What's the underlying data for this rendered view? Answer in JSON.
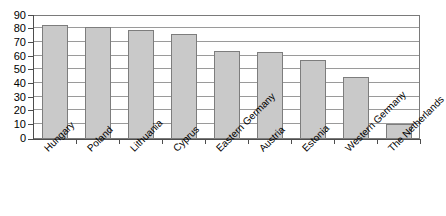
{
  "chart_data": {
    "type": "bar",
    "title": "",
    "subtitle": "",
    "xlabel": "",
    "ylabel": "",
    "ylim": [
      0,
      90
    ],
    "ytick_step": 10,
    "yticks": [
      0,
      10,
      20,
      30,
      40,
      50,
      60,
      70,
      80,
      90
    ],
    "ytick_labels": [
      "0",
      "10",
      "20",
      "30",
      "40",
      "50",
      "60",
      "70",
      "80",
      "90"
    ],
    "grid": true,
    "grid_axis": "y",
    "legend": false,
    "legend_position": "none",
    "orientation": "vertical",
    "label_rotation": -45,
    "categories": [
      "Hungary",
      "Poland",
      "Lithuania",
      "Cyprus",
      "Eastern Germany",
      "Austria",
      "Estonia",
      "Western Germany",
      "The Netherlands"
    ],
    "values": [
      83,
      81,
      79,
      76,
      64,
      63,
      57,
      45,
      11
    ],
    "series": [
      {
        "name": "",
        "values": [
          83,
          81,
          79,
          76,
          64,
          63,
          57,
          45,
          11
        ]
      }
    ],
    "annotations": []
  },
  "style": {
    "bar_fill": "#c9c9c9",
    "bar_border": "#7d7d7d",
    "gridline_color": "#9a9a9a",
    "axis_color": "#4d4d4d",
    "frame_color": "#7a7a7a",
    "background": "#ffffff",
    "text_color": "#000000"
  }
}
